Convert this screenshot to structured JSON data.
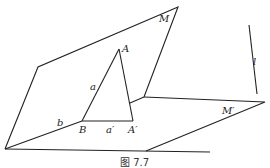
{
  "figure": {
    "caption": "图 7.7",
    "labels": {
      "M": "M",
      "M_prime": "M′",
      "A": "A",
      "A_prime": "A′",
      "B": "B",
      "a": "a",
      "a_prime": "a′",
      "b": "b",
      "l": "l"
    },
    "colors": {
      "stroke": "#222222",
      "background": "#ffffff"
    }
  }
}
